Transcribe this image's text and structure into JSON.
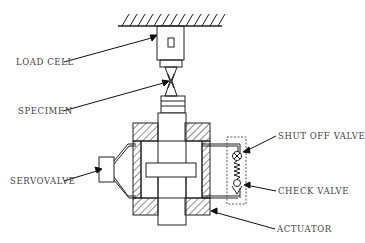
{
  "diagram": {
    "type": "hydraulic test rig schematic",
    "labels": {
      "load_cell": "LOAD CELL",
      "specimen": "SPECIMEN",
      "servovalve": "SERVOVALVE",
      "shut_off_valve": "SHUT OFF VALVE",
      "check_valve": "CHECK VALVE",
      "actuator": "ACTUATOR"
    },
    "colors": {
      "line": "#222222",
      "text": "#444444",
      "background": "#ffffff"
    }
  }
}
